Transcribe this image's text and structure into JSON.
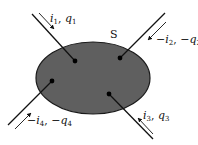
{
  "diagram": {
    "region_label": "S",
    "colors": {
      "region_fill": "#5f5f5f",
      "region_stroke": "#1a1a1a",
      "line": "#111111",
      "background": "#ffffff"
    },
    "terminals": [
      {
        "id": 1,
        "current": "i",
        "current_sub": "1",
        "charge": "q",
        "charge_sub": "1",
        "sign": "",
        "label_text": "i1, q1",
        "direction": "into region"
      },
      {
        "id": 2,
        "current": "i",
        "current_sub": "2",
        "charge": "q",
        "charge_sub": "2",
        "sign": "−",
        "label_text": "−i2, −q2",
        "direction": "into region"
      },
      {
        "id": 3,
        "current": "i",
        "current_sub": "3",
        "charge": "q",
        "charge_sub": "3",
        "sign": "",
        "label_text": "i3, q3",
        "direction": "out of region"
      },
      {
        "id": 4,
        "current": "i",
        "current_sub": "4",
        "charge": "q",
        "charge_sub": "4",
        "sign": "−",
        "label_text": "−i4, −q4",
        "direction": "into region"
      }
    ],
    "comma": ", "
  }
}
